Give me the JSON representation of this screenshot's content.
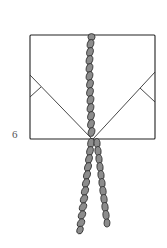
{
  "diagram": {
    "step_number": "6",
    "colors": {
      "outline": "#222222",
      "cord_fill": "#8c8c8c",
      "background": "#ffffff",
      "label": "#555555"
    }
  }
}
